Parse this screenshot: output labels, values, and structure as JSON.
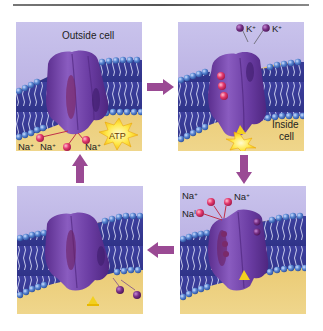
{
  "figure": {
    "colors": {
      "outside": "#c6bfe9",
      "inside": "#e6c366",
      "membrane_heads": "#4a78c8",
      "membrane_tails": "#3d3f9e",
      "protein": "#6a3ea0",
      "sodium": "#e0356a",
      "potassium": "#6b2b78",
      "arrow": "#9a4a94",
      "atp_burst": "#ffe84a",
      "phosphate": "#f2d020"
    }
  },
  "panels": [
    {
      "id": "step-1",
      "labels": {
        "region": "Outside cell",
        "ions": [
          "Na",
          "Na",
          "Na"
        ],
        "ion_charge": "+",
        "atp": "ATP"
      }
    },
    {
      "id": "step-2",
      "labels": {
        "ions": [
          "K",
          "K"
        ],
        "ion_charge": "+",
        "region_line1": "Inside",
        "region_line2": "cell"
      }
    },
    {
      "id": "step-3",
      "labels": {
        "ions": [
          "Na",
          "Na",
          "Na"
        ],
        "ion_charge": "+",
        "ion_charge_alt": "I"
      }
    },
    {
      "id": "step-4",
      "labels": {}
    }
  ],
  "arrows": [
    {
      "from": "step-1",
      "to": "step-2",
      "direction": "right"
    },
    {
      "from": "step-2",
      "to": "step-3",
      "direction": "down"
    },
    {
      "from": "step-3",
      "to": "step-4",
      "direction": "left"
    },
    {
      "from": "step-4",
      "to": "step-1",
      "direction": "up"
    }
  ]
}
